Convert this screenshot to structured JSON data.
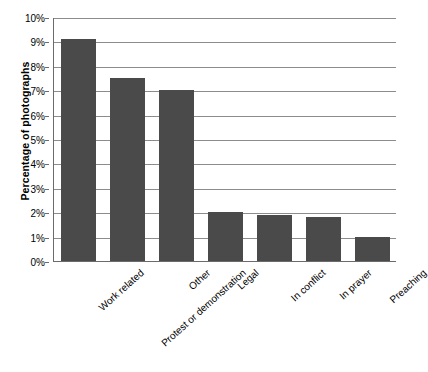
{
  "chart_data": {
    "type": "bar",
    "title": "",
    "subtitle": "",
    "xlabel": "",
    "ylabel": "Percentage of photographs",
    "categories": [
      "Work related",
      "Protest or demonstration",
      "Other",
      "Legal",
      "In conflict",
      "In prayer",
      "Preaching"
    ],
    "values": [
      9.1,
      7.5,
      7.0,
      2.0,
      1.9,
      1.8,
      1.0
    ],
    "value_unit": "%",
    "ylim": [
      0,
      10
    ],
    "ytick_step": 1,
    "ytick_labels": [
      "0%",
      "1%",
      "2%",
      "3%",
      "4%",
      "5%",
      "6%",
      "7%",
      "8%",
      "9%",
      "10%"
    ],
    "grid": "horizontal",
    "legend": "none",
    "bar_color": "#4a4a4a",
    "gridline_color": "#8c8c8c",
    "axis_color": "#6b6b6b",
    "background_color": "#ffffff"
  }
}
